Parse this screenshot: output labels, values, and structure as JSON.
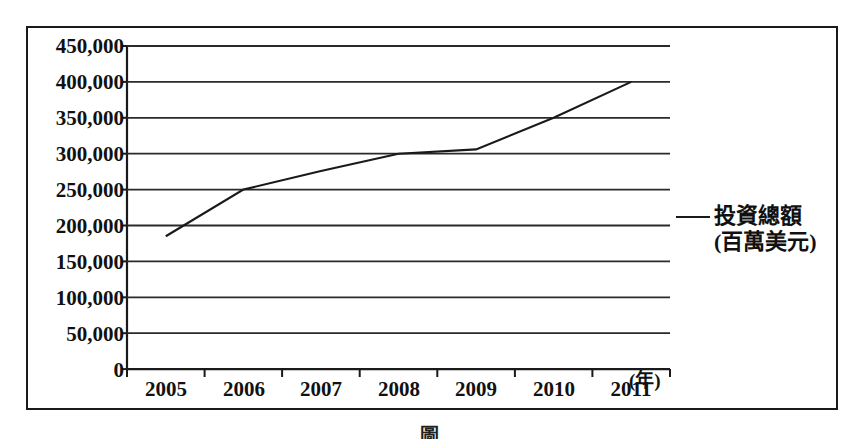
{
  "chart_data": {
    "type": "line",
    "title": "",
    "xlabel": "(年)",
    "ylabel": "",
    "categories": [
      "2005",
      "2006",
      "2007",
      "2008",
      "2009",
      "2010",
      "2011"
    ],
    "x": [
      2005,
      2006,
      2007,
      2008,
      2009,
      2010,
      2011
    ],
    "series": [
      {
        "name": "投資總額(百萬美元)",
        "values": [
          185000,
          250000,
          276000,
          300000,
          306000,
          350000,
          400000
        ],
        "color": "#1a1a1a"
      }
    ],
    "ylim": [
      0,
      450000
    ],
    "yticks": [
      0,
      50000,
      100000,
      150000,
      200000,
      250000,
      300000,
      350000,
      400000,
      450000
    ],
    "ytick_labels": [
      "0",
      "50,000",
      "100,000",
      "150,000",
      "200,000",
      "250,000",
      "300,000",
      "350,000",
      "400,000",
      "450,000"
    ],
    "xtick_labels": [
      "2005",
      "2006",
      "2007",
      "2008",
      "2009",
      "2010",
      "2011"
    ],
    "grid": true,
    "grid_axis": "y",
    "legend_position": "right"
  },
  "legend": {
    "line1": "投資總額",
    "line2": "(百萬美元)",
    "marker": "line-swatch"
  },
  "axis": {
    "x_unit": "(年)"
  },
  "caption": {
    "text": "圖"
  },
  "colors": {
    "line": "#1a1a1a",
    "grid": "#2a2a2a",
    "frame": "#1a1a1a",
    "text": "#111111",
    "background": "#ffffff"
  }
}
